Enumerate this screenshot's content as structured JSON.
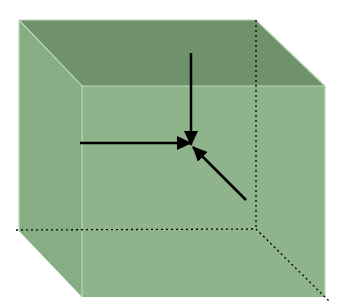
{
  "diagram": {
    "type": "cube-with-force-arrows",
    "colors": {
      "background": "#ffffff",
      "top_face": "#6f916c",
      "left_face": "#86ad83",
      "front_face": "#8fb48c",
      "edge_highlight": "#b9d9b3",
      "arrow": "#000000",
      "hidden_edge": "#000000"
    },
    "arrows": [
      {
        "name": "vertical",
        "from": [
          191,
          53
        ],
        "to": [
          191,
          143
        ]
      },
      {
        "name": "horizontal",
        "from": [
          80,
          143
        ],
        "to": [
          189,
          143
        ]
      },
      {
        "name": "diagonal",
        "from": [
          246,
          200
        ],
        "to": [
          194,
          148
        ]
      }
    ]
  }
}
